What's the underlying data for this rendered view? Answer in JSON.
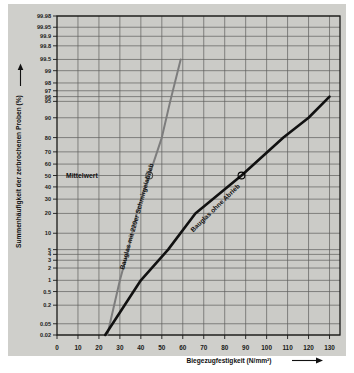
{
  "chart_data": {
    "type": "line",
    "title": "",
    "xlabel": "Biegezugfestigkeit (N/mm²)",
    "ylabel": "Summenhäufigkeit der zerbrochenen Proben (%)",
    "plot_kind": "weibull-probability-plot",
    "grid": true,
    "legend_position": "inline-on-curve",
    "xlim": [
      0,
      135
    ],
    "xticks": [
      0,
      10,
      20,
      30,
      40,
      50,
      60,
      70,
      80,
      90,
      100,
      110,
      120,
      130
    ],
    "xtick_labels": [
      "0",
      "10",
      "20",
      "30",
      "40",
      "50",
      "60",
      "70",
      "80",
      "90",
      "100",
      "110",
      "120",
      "130"
    ],
    "ylim_percent": [
      0.02,
      99.98
    ],
    "yticks": [
      99.98,
      99.95,
      99.9,
      99.8,
      99.5,
      99,
      98,
      97,
      96,
      95,
      90,
      80,
      70,
      60,
      50,
      40,
      30,
      20,
      10,
      5,
      4,
      3,
      2,
      1,
      0.5,
      0.2,
      0.05,
      0.02
    ],
    "ytick_labels": [
      "99.98",
      "99.95",
      "99.9",
      "99.8",
      "99.5",
      "99",
      "98",
      "97",
      "96",
      "95",
      "90",
      "80",
      "70",
      "60",
      "50",
      "40",
      "30",
      "20",
      "10",
      "5",
      "4",
      "3",
      "2",
      "1",
      "0.5",
      "0.2",
      "0.05",
      "0.02"
    ],
    "annotations": [
      {
        "name": "mean-line-label",
        "text": "Mittelwert",
        "x_percent": 50,
        "note": "horizontal reference at 50 % cumulative frequency"
      }
    ],
    "series": [
      {
        "name": "Bauglas mit 220er Schmirgelabrieb",
        "color": "#7d7d7d",
        "label": "Bauglas mit 220er Schmirgelabrieb",
        "mean_value": 44,
        "marker_at_50_percent": 44,
        "points": [
          {
            "x": 24,
            "y": 0.02
          },
          {
            "x": 30,
            "y": 1
          },
          {
            "x": 34,
            "y": 5
          },
          {
            "x": 38,
            "y": 20
          },
          {
            "x": 44,
            "y": 50
          },
          {
            "x": 50,
            "y": 80
          },
          {
            "x": 54,
            "y": 95
          },
          {
            "x": 59,
            "y": 99.5
          }
        ]
      },
      {
        "name": "Bauglas ohne Abrieb",
        "color": "#111111",
        "label": "Bauglas ohne Abrieb",
        "mean_value": 88,
        "marker_at_50_percent": 88,
        "points": [
          {
            "x": 23,
            "y": 0.02
          },
          {
            "x": 40,
            "y": 1
          },
          {
            "x": 53,
            "y": 5
          },
          {
            "x": 66,
            "y": 20
          },
          {
            "x": 88,
            "y": 50
          },
          {
            "x": 108,
            "y": 80
          },
          {
            "x": 120,
            "y": 90
          },
          {
            "x": 130,
            "y": 96
          }
        ]
      }
    ]
  },
  "axes": {
    "x_title": "Biegezugfestigkeit (N/mm²)",
    "y_title": "Summenhäufigkeit der zerbrochenen Proben (%)",
    "x_arrow": "arrow-right-icon",
    "y_arrow": "arrow-up-icon"
  },
  "colors": {
    "paper": "#cfcfcb",
    "grid": "#5e5e5c",
    "frame": "#1a1a18",
    "series_abraded": "#7d7d7d",
    "series_plain": "#111111",
    "text": "#111111"
  }
}
